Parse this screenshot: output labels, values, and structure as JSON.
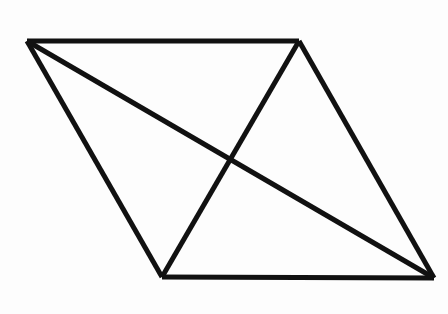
{
  "figure": {
    "name": "parallelogram-with-diagonals",
    "background_color": "#fdfdfd",
    "stroke_color": "#111111",
    "stroke_width": 5,
    "canvas": {
      "width": 448,
      "height": 314
    },
    "vertices": [
      {
        "id": "A",
        "role": "top-left",
        "x": 27,
        "y": 41
      },
      {
        "id": "B",
        "role": "top-right",
        "x": 299,
        "y": 41
      },
      {
        "id": "C",
        "role": "bottom-left",
        "x": 162,
        "y": 277
      },
      {
        "id": "D",
        "role": "bottom-right",
        "x": 434,
        "y": 278
      }
    ],
    "intersection": {
      "id": "X",
      "role": "diagonal-crossing",
      "x": 228,
      "y": 162
    },
    "edges": [
      {
        "id": "top-edge",
        "from": "A",
        "to": "B",
        "x1": 27,
        "y1": 41,
        "x2": 299,
        "y2": 41
      },
      {
        "id": "right-edge",
        "from": "B",
        "to": "D",
        "x1": 299,
        "y1": 41,
        "x2": 434,
        "y2": 278
      },
      {
        "id": "bottom-edge",
        "from": "C",
        "to": "D",
        "x1": 162,
        "y1": 277,
        "x2": 434,
        "y2": 278
      },
      {
        "id": "left-edge",
        "from": "A",
        "to": "C",
        "x1": 27,
        "y1": 41,
        "x2": 162,
        "y2": 277
      },
      {
        "id": "diagonal-a-d",
        "from": "A",
        "to": "D",
        "x1": 27,
        "y1": 41,
        "x2": 434,
        "y2": 278
      },
      {
        "id": "diagonal-b-c",
        "from": "B",
        "to": "C",
        "x1": 299,
        "y1": 41,
        "x2": 162,
        "y2": 277
      }
    ],
    "outline_path": "M 27 41 L 299 41 L 434 278 L 162 277 Z"
  }
}
